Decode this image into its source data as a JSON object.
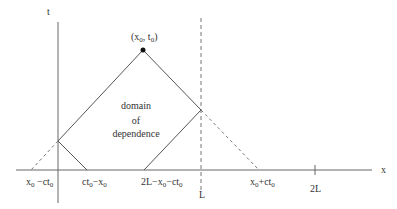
{
  "diagram": {
    "axes": {
      "t_label": "t",
      "x_label": "x"
    },
    "apex": {
      "label_main": "(x",
      "label_sub1": "0",
      "label_mid": ", t",
      "label_sub2": "0",
      "label_end": ")"
    },
    "region_label": {
      "line1": "domain",
      "line2": "of",
      "line3": "dependence"
    },
    "x_ticks": [
      {
        "main": "x",
        "sub": "0",
        "rest": " −ct",
        "sub2": "0"
      },
      {
        "main": "ct",
        "sub": "0",
        "rest": "−x",
        "sub2": "0"
      },
      {
        "main": "2L−x",
        "sub": "0",
        "rest": "−ct",
        "sub2": "0"
      },
      {
        "main": "L"
      },
      {
        "main": "x",
        "sub": "0",
        "rest": "+ct",
        "sub2": "0"
      },
      {
        "main": "2L"
      }
    ],
    "colors": {
      "line": "#555555",
      "dashed": "#777777",
      "text": "#333333"
    }
  }
}
